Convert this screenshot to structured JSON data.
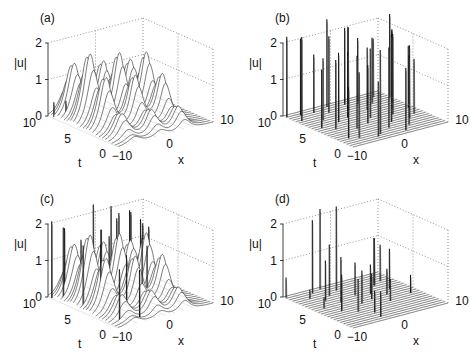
{
  "chart_data": [
    {
      "type": "surface",
      "panel_label": "(a)",
      "zlabel": "|u|",
      "xlabel": "x",
      "ylabel": "t",
      "zticks": [
        "0",
        "1",
        "2"
      ],
      "xticks": [
        "-10",
        "0",
        "10"
      ],
      "tticks": [
        "0",
        "5",
        "10"
      ],
      "xlim": [
        -10,
        10
      ],
      "tlim": [
        0,
        10
      ],
      "zlim": [
        0,
        2
      ],
      "solitons": [
        {
          "x0": -6.5,
          "t_start": 0,
          "t_end": 10,
          "amp_max": 1.9,
          "t_peak": 6.5,
          "width": 1.1,
          "drift": 0
        },
        {
          "x0": -1.0,
          "t_start": 0,
          "t_end": 10,
          "amp_max": 1.75,
          "t_peak": 6.0,
          "width": 1.0,
          "drift": 0
        },
        {
          "x0": 4.0,
          "t_start": 0,
          "t_end": 10,
          "amp_max": 1.65,
          "t_peak": 5.5,
          "width": 1.0,
          "drift": 0
        }
      ],
      "spikes": [
        {
          "x": -9.5,
          "t": 9.5,
          "z": 0.4
        },
        {
          "x": -8.0,
          "t": 8.8,
          "z": 0.45
        },
        {
          "x": -6.5,
          "t": 8.6,
          "z": 0.35
        },
        {
          "x": -5.0,
          "t": 7.6,
          "z": 0.4
        },
        {
          "x": -3.5,
          "t": 5.8,
          "z": 0.3
        },
        {
          "x": -2.0,
          "t": 4.8,
          "z": 0.35
        },
        {
          "x": -1.0,
          "t": 3.8,
          "z": 0.3
        },
        {
          "x": 0.5,
          "t": 3.0,
          "z": 0.25
        }
      ]
    },
    {
      "type": "surface",
      "panel_label": "(b)",
      "zlabel": "|u|",
      "xlabel": "x",
      "ylabel": "t",
      "zticks": [
        "0",
        "1",
        "2"
      ],
      "xticks": [
        "-10",
        "0",
        "10"
      ],
      "tticks": [
        "0",
        "5",
        "10"
      ],
      "xlim": [
        -10,
        10
      ],
      "tlim": [
        0,
        10
      ],
      "zlim": [
        0,
        2
      ],
      "solitons": [],
      "spikes": [
        {
          "x": -9.8,
          "t": 9.6,
          "z": 2.2
        },
        {
          "x": -9.0,
          "t": 8.0,
          "z": 2.3
        },
        {
          "x": -8.5,
          "t": 5.5,
          "z": 1.6
        },
        {
          "x": -7.5,
          "t": 9.2,
          "z": 2.1
        },
        {
          "x": -7.0,
          "t": 4.5,
          "z": 1.9
        },
        {
          "x": -6.0,
          "t": 7.0,
          "z": 1.7
        },
        {
          "x": -5.5,
          "t": 2.5,
          "z": 2.2
        },
        {
          "x": -5.0,
          "t": 9.0,
          "z": 1.6
        },
        {
          "x": -4.5,
          "t": 5.8,
          "z": 1.9
        },
        {
          "x": -4.0,
          "t": 3.5,
          "z": 2.0
        },
        {
          "x": -3.0,
          "t": 8.2,
          "z": 2.1
        },
        {
          "x": -2.5,
          "t": 1.2,
          "z": 2.3
        },
        {
          "x": -2.0,
          "t": 6.2,
          "z": 1.8
        },
        {
          "x": -1.5,
          "t": 9.5,
          "z": 2.4
        },
        {
          "x": -1.0,
          "t": 4.0,
          "z": 1.6
        },
        {
          "x": 0.0,
          "t": 7.5,
          "z": 2.3
        },
        {
          "x": 0.5,
          "t": 2.0,
          "z": 2.2
        },
        {
          "x": 1.0,
          "t": 5.0,
          "z": 1.9
        },
        {
          "x": 1.5,
          "t": 9.0,
          "z": 2.1
        },
        {
          "x": 2.5,
          "t": 3.0,
          "z": 2.4
        },
        {
          "x": 3.0,
          "t": 6.8,
          "z": 1.7
        },
        {
          "x": 3.5,
          "t": 8.5,
          "z": 1.8
        },
        {
          "x": 4.0,
          "t": 1.5,
          "z": 1.9
        },
        {
          "x": 5.0,
          "t": 4.5,
          "z": 2.2
        },
        {
          "x": 5.5,
          "t": 7.8,
          "z": 1.8
        },
        {
          "x": 6.0,
          "t": 2.8,
          "z": 2.0
        },
        {
          "x": 7.0,
          "t": 6.0,
          "z": 2.1
        },
        {
          "x": 7.5,
          "t": 9.0,
          "z": 1.6
        },
        {
          "x": 8.0,
          "t": 3.5,
          "z": 1.5
        },
        {
          "x": 8.5,
          "t": 7.0,
          "z": 2.0
        },
        {
          "x": 9.0,
          "t": 5.0,
          "z": 1.7
        },
        {
          "x": 9.5,
          "t": 8.0,
          "z": 2.3
        },
        {
          "x": -6.5,
          "t": 1.5,
          "z": 1.8
        },
        {
          "x": -3.5,
          "t": 0.8,
          "z": 1.5
        },
        {
          "x": 2.0,
          "t": 0.6,
          "z": 1.7
        },
        {
          "x": -8.0,
          "t": 2.0,
          "z": 1.4
        }
      ]
    },
    {
      "type": "surface",
      "panel_label": "(c)",
      "zlabel": "|u|",
      "xlabel": "x",
      "ylabel": "t",
      "zticks": [
        "0",
        "1",
        "2"
      ],
      "xticks": [
        "-10",
        "0",
        "10"
      ],
      "tticks": [
        "0",
        "5",
        "10"
      ],
      "xlim": [
        -10,
        10
      ],
      "tlim": [
        0,
        10
      ],
      "zlim": [
        0,
        2
      ],
      "solitons": [
        {
          "x0": -6.5,
          "t_start": 0,
          "t_end": 10,
          "amp_max": 1.9,
          "t_peak": 6.5,
          "width": 1.1,
          "drift": 0
        },
        {
          "x0": -1.0,
          "t_start": 0,
          "t_end": 10,
          "amp_max": 1.75,
          "t_peak": 6.0,
          "width": 1.0,
          "drift": 0
        },
        {
          "x0": 4.0,
          "t_start": 0,
          "t_end": 10,
          "amp_max": 1.65,
          "t_peak": 5.5,
          "width": 1.0,
          "drift": 0
        }
      ],
      "spikes": [
        {
          "x": -9.8,
          "t": 9.6,
          "z": 2.1
        },
        {
          "x": -9.0,
          "t": 8.5,
          "z": 2.0
        },
        {
          "x": -8.5,
          "t": 6.0,
          "z": 1.7
        },
        {
          "x": -8.0,
          "t": 9.0,
          "z": 1.9
        },
        {
          "x": -7.0,
          "t": 4.5,
          "z": 1.8
        },
        {
          "x": -6.0,
          "t": 8.0,
          "z": 1.6
        },
        {
          "x": -5.5,
          "t": 2.5,
          "z": 1.6
        },
        {
          "x": -4.5,
          "t": 5.0,
          "z": 1.9
        },
        {
          "x": -3.5,
          "t": 3.2,
          "z": 1.5
        },
        {
          "x": -2.5,
          "t": 7.5,
          "z": 1.8
        },
        {
          "x": -1.5,
          "t": 9.3,
          "z": 2.3
        },
        {
          "x": -0.5,
          "t": 3.0,
          "z": 1.9
        },
        {
          "x": 0.5,
          "t": 7.0,
          "z": 2.2
        },
        {
          "x": 1.5,
          "t": 8.8,
          "z": 2.2
        },
        {
          "x": 2.0,
          "t": 4.0,
          "z": 1.5
        },
        {
          "x": 3.0,
          "t": 9.0,
          "z": 1.8
        },
        {
          "x": 4.5,
          "t": 8.0,
          "z": 2.0
        },
        {
          "x": 6.0,
          "t": 9.2,
          "z": 1.9
        },
        {
          "x": 7.0,
          "t": 8.0,
          "z": 1.6
        },
        {
          "x": 8.0,
          "t": 9.0,
          "z": 1.6
        },
        {
          "x": 9.0,
          "t": 8.5,
          "z": 1.4
        },
        {
          "x": -7.5,
          "t": 1.5,
          "z": 1.4
        },
        {
          "x": -4.0,
          "t": 1.0,
          "z": 1.3
        }
      ]
    },
    {
      "type": "surface",
      "panel_label": "(d)",
      "zlabel": "|u|",
      "xlabel": "x",
      "ylabel": "t",
      "zticks": [
        "0",
        "1",
        "2"
      ],
      "xticks": [
        "-10",
        "0",
        "10"
      ],
      "tticks": [
        "0",
        "5",
        "10"
      ],
      "xlim": [
        -10,
        10
      ],
      "tlim": [
        0,
        10
      ],
      "zlim": [
        0,
        2
      ],
      "solitons": [],
      "spikes": [
        {
          "x": -9.8,
          "t": 9.7,
          "z": 0.55
        },
        {
          "x": -8.0,
          "t": 5.5,
          "z": 0.3
        },
        {
          "x": -7.0,
          "t": 8.2,
          "z": 0.25
        },
        {
          "x": -6.5,
          "t": 4.0,
          "z": 1.0
        },
        {
          "x": -5.5,
          "t": 7.0,
          "z": 1.1
        },
        {
          "x": -5.0,
          "t": 9.2,
          "z": 2.0
        },
        {
          "x": -4.5,
          "t": 3.0,
          "z": 0.9
        },
        {
          "x": -4.0,
          "t": 5.8,
          "z": 1.25
        },
        {
          "x": -3.5,
          "t": 7.8,
          "z": 1.4
        },
        {
          "x": -2.8,
          "t": 9.6,
          "z": 2.2
        },
        {
          "x": -2.5,
          "t": 2.0,
          "z": 0.6
        },
        {
          "x": -1.5,
          "t": 4.5,
          "z": 0.9
        },
        {
          "x": -1.0,
          "t": 8.5,
          "z": 2.3
        },
        {
          "x": 0.0,
          "t": 6.5,
          "z": 0.9
        },
        {
          "x": 0.5,
          "t": 2.5,
          "z": 0.5
        },
        {
          "x": 1.0,
          "t": 4.8,
          "z": 0.7
        },
        {
          "x": 2.5,
          "t": 6.0,
          "z": 0.8
        },
        {
          "x": 3.0,
          "t": 3.5,
          "z": 0.6
        },
        {
          "x": 4.5,
          "t": 5.0,
          "z": 0.7
        },
        {
          "x": 5.5,
          "t": 7.5,
          "z": 1.3
        },
        {
          "x": 6.5,
          "t": 6.0,
          "z": 1.1
        },
        {
          "x": 7.5,
          "t": 8.0,
          "z": 1.0
        },
        {
          "x": 8.0,
          "t": 4.0,
          "z": 0.5
        },
        {
          "x": -3.0,
          "t": 0.8,
          "z": 0.7
        }
      ]
    }
  ],
  "panels": [
    {
      "label": "(a)",
      "zlabel": "|u|",
      "xlabel": "x",
      "tlabel": "t"
    },
    {
      "label": "(b)",
      "zlabel": "|u|",
      "xlabel": "x",
      "tlabel": "t"
    },
    {
      "label": "(c)",
      "zlabel": "|u|",
      "xlabel": "x",
      "tlabel": "t"
    },
    {
      "label": "(d)",
      "zlabel": "|u|",
      "xlabel": "x",
      "tlabel": "t"
    }
  ],
  "colors": {
    "line": "#111111",
    "grid": "#666666",
    "surface_fill": "#ffffff",
    "background": "#ffffff"
  }
}
